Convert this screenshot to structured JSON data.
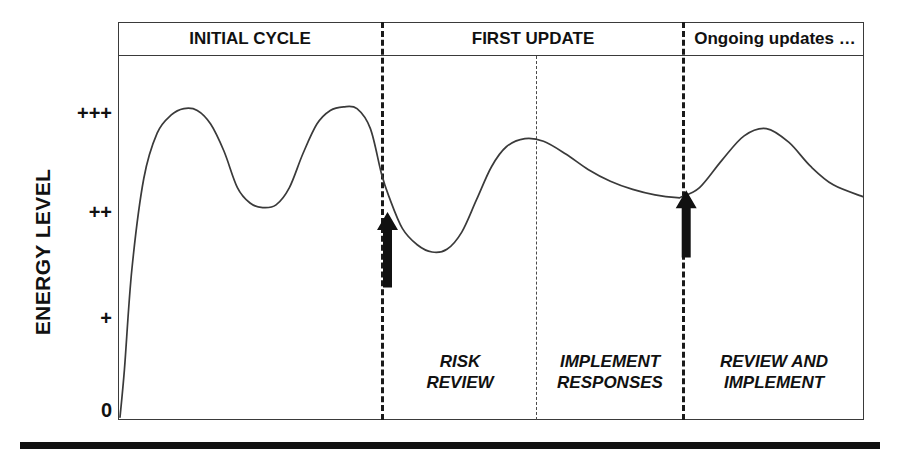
{
  "chart_data": {
    "type": "line",
    "title": "",
    "subtitle": "",
    "xlabel": "",
    "ylabel": "ENERGY LEVEL",
    "ylim": [
      0,
      4
    ],
    "xlim": [
      0,
      100
    ],
    "grid": false,
    "legend": null,
    "y_tick_labels": [
      "+++",
      "++",
      "+",
      "0"
    ],
    "y_tick_values": [
      3,
      2,
      1,
      0
    ],
    "x_tick_labels": [],
    "series": [
      {
        "name": "Energy level over risk-management cycle",
        "x": [
          0.0,
          0.6,
          1.6,
          3.2,
          5.0,
          6.9,
          8.6,
          10.4,
          12.2,
          14.0,
          15.8,
          17.5,
          19.2,
          21.0,
          22.8,
          24.6,
          26.5,
          28.3,
          30.1,
          31.9,
          33.7,
          35.2,
          36.2,
          38.0,
          40.0,
          42.0,
          44.0,
          46.0,
          48.0,
          50.0,
          52.0,
          54.5,
          57.0,
          60.0,
          63.0,
          66.0,
          69.0,
          72.0,
          75.0,
          75.6,
          78.0,
          81.0,
          84.0,
          87.0,
          90.0,
          93.0,
          96.0,
          100.0
        ],
        "y": [
          0.02,
          0.55,
          1.65,
          2.65,
          3.15,
          3.35,
          3.42,
          3.4,
          3.25,
          2.95,
          2.55,
          2.38,
          2.33,
          2.36,
          2.55,
          2.92,
          3.25,
          3.4,
          3.44,
          3.42,
          3.2,
          2.7,
          2.45,
          2.1,
          1.92,
          1.84,
          1.87,
          2.06,
          2.42,
          2.78,
          3.0,
          3.09,
          3.06,
          2.92,
          2.75,
          2.62,
          2.53,
          2.47,
          2.44,
          2.45,
          2.55,
          2.85,
          3.12,
          3.2,
          3.05,
          2.78,
          2.58,
          2.45
        ]
      }
    ],
    "annotations": [
      {
        "name": "risk-review-arrow",
        "type": "up-arrow",
        "x": 36.0,
        "y_base": 1.45,
        "y_tip": 2.28
      },
      {
        "name": "review-implement-arrow",
        "type": "up-arrow",
        "x": 76.2,
        "y_base": 1.78,
        "y_tip": 2.52
      }
    ],
    "phase_dividers": [
      {
        "name": "initial-cycle-end",
        "x": 35.2,
        "style": "thick-dashed"
      },
      {
        "name": "risk-review-end",
        "x": 56.0,
        "style": "thin-dashed"
      },
      {
        "name": "first-update-end",
        "x": 75.6,
        "style": "thick-dashed"
      }
    ]
  },
  "axis": {
    "y_title": "ENERGY LEVEL",
    "ticks": [
      {
        "label": "+++",
        "top": 103
      },
      {
        "label": "++",
        "top": 202
      },
      {
        "label": "+",
        "top": 308
      },
      {
        "label": "0",
        "top": 400
      }
    ]
  },
  "phases": [
    {
      "key": "initial-cycle",
      "label": "INITIAL CYCLE",
      "left": 120,
      "width": 260
    },
    {
      "key": "first-update",
      "label": "FIRST UPDATE",
      "left": 386,
      "width": 294
    },
    {
      "key": "ongoing-updates",
      "label": "Ongoing updates …",
      "left": 688,
      "width": 174
    }
  ],
  "subphases": [
    {
      "key": "risk-review",
      "line1": "RISK",
      "line2": "REVIEW",
      "left": 386,
      "width": 148,
      "top": 352
    },
    {
      "key": "implement-responses",
      "line1": "IMPLEMENT",
      "line2": "RESPONSES",
      "left": 540,
      "width": 140,
      "top": 352
    },
    {
      "key": "review-implement",
      "line1": "REVIEW AND",
      "line2": "IMPLEMENT",
      "left": 688,
      "width": 172,
      "top": 352
    }
  ],
  "dividers": [
    {
      "key": "divider-initial-first",
      "left": 381,
      "top": 22,
      "height": 398,
      "style": "thick"
    },
    {
      "key": "divider-risk-implement",
      "left": 536,
      "top": 56,
      "height": 364,
      "style": "thin"
    },
    {
      "key": "divider-first-ongoing",
      "left": 682,
      "top": 22,
      "height": 398,
      "style": "thick"
    }
  ],
  "colors": {
    "line": "#3a3a3a",
    "frame": "#3a3a3a",
    "text": "#111111",
    "arrow": "#111111",
    "background": "#ffffff"
  }
}
